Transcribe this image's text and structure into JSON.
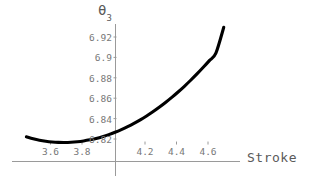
{
  "chart_data": {
    "type": "line",
    "title": "",
    "xlabel": "Stroke",
    "ylabel": "θ₃",
    "ylabel_base": "θ",
    "ylabel_sub": "3",
    "xlim": [
      3.44,
      4.72
    ],
    "ylim": [
      6.8145,
      6.932
    ],
    "grid": false,
    "legend": null,
    "axis_origin": {
      "x": 4.0,
      "y": 6.8175
    },
    "xticks": [
      3.6,
      3.8,
      4.2,
      4.4,
      4.6
    ],
    "xtick_labels": [
      "3.6",
      "3.8",
      "4.2",
      "4.4",
      "4.6"
    ],
    "yticks": [
      6.82,
      6.84,
      6.86,
      6.88,
      6.9,
      6.92
    ],
    "ytick_labels": [
      "6.82",
      "6.84",
      "6.86",
      "6.88",
      "6.9",
      "6.92"
    ],
    "series": [
      {
        "name": "theta3",
        "color": "#000000",
        "linewidth": 3.1,
        "x": [
          3.447,
          3.49,
          3.53,
          3.57,
          3.61,
          3.65,
          3.69,
          3.73,
          3.77,
          3.81,
          3.85,
          3.89,
          3.93,
          3.97,
          4.01,
          4.05,
          4.09,
          4.13,
          4.17,
          4.21,
          4.25,
          4.29,
          4.33,
          4.37,
          4.41,
          4.45,
          4.49,
          4.53,
          4.57,
          4.61,
          4.65,
          4.7
        ],
        "y": [
          6.8221,
          6.8202,
          6.8188,
          6.8178,
          6.8171,
          6.8167,
          6.8166,
          6.8168,
          6.8173,
          6.8181,
          6.8192,
          6.8206,
          6.8223,
          6.8243,
          6.8266,
          6.8292,
          6.8321,
          6.8353,
          6.8388,
          6.8426,
          6.8467,
          6.8511,
          6.8558,
          6.8608,
          6.8661,
          6.8717,
          6.8776,
          6.8838,
          6.8903,
          6.8971,
          6.9042,
          6.9295
        ]
      }
    ]
  },
  "axes": {
    "axis_color": "#9a9a9a",
    "tick_color": "#9a9a9a",
    "label_color": "#787878",
    "title_color": "#5a5a5a"
  },
  "background": "#ffffff"
}
